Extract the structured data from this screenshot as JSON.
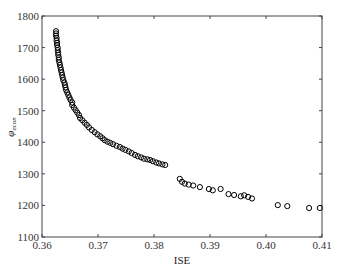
{
  "chart_data": {
    "type": "scatter",
    "title": "",
    "xlabel": "ISE",
    "ylabel": "φ_econ",
    "ylabel_main": "φ",
    "ylabel_sub": "econ",
    "xlim": [
      0.36,
      0.41
    ],
    "ylim": [
      1100,
      1800
    ],
    "xticks": [
      0.36,
      0.37,
      0.38,
      0.39,
      0.4,
      0.41
    ],
    "xtick_labels": [
      "0.36",
      "0.37",
      "0.38",
      "0.39",
      "0.40",
      "0.41"
    ],
    "yticks": [
      1100,
      1200,
      1300,
      1400,
      1500,
      1600,
      1700,
      1800
    ],
    "ytick_labels": [
      "1100",
      "1200",
      "1300",
      "1400",
      "1500",
      "1600",
      "1700",
      "1800"
    ],
    "grid": false,
    "legend": null,
    "marker": "open-circle",
    "marker_color": "#000000",
    "series": [
      {
        "name": "Pareto front",
        "points": [
          [
            0.3625,
            1752
          ],
          [
            0.3625,
            1745
          ],
          [
            0.3625,
            1738
          ],
          [
            0.3626,
            1730
          ],
          [
            0.3626,
            1722
          ],
          [
            0.3627,
            1715
          ],
          [
            0.3627,
            1708
          ],
          [
            0.3628,
            1700
          ],
          [
            0.3628,
            1692
          ],
          [
            0.3629,
            1684
          ],
          [
            0.3629,
            1677
          ],
          [
            0.363,
            1669
          ],
          [
            0.363,
            1661
          ],
          [
            0.3631,
            1653
          ],
          [
            0.3632,
            1645
          ],
          [
            0.3633,
            1637
          ],
          [
            0.3634,
            1629
          ],
          [
            0.3635,
            1621
          ],
          [
            0.3636,
            1613
          ],
          [
            0.3637,
            1605
          ],
          [
            0.3638,
            1597
          ],
          [
            0.364,
            1589
          ],
          [
            0.3641,
            1581
          ],
          [
            0.3642,
            1574
          ],
          [
            0.3643,
            1566
          ],
          [
            0.3645,
            1558
          ],
          [
            0.3647,
            1550
          ],
          [
            0.3649,
            1542
          ],
          [
            0.3651,
            1534
          ],
          [
            0.3654,
            1526
          ],
          [
            0.3654,
            1518
          ],
          [
            0.3657,
            1510
          ],
          [
            0.366,
            1502
          ],
          [
            0.3663,
            1494
          ],
          [
            0.3666,
            1486
          ],
          [
            0.3668,
            1477
          ],
          [
            0.3672,
            1470
          ],
          [
            0.3676,
            1462
          ],
          [
            0.368,
            1455
          ],
          [
            0.3684,
            1447
          ],
          [
            0.3689,
            1439
          ],
          [
            0.3694,
            1432
          ],
          [
            0.3699,
            1425
          ],
          [
            0.3704,
            1419
          ],
          [
            0.3708,
            1413
          ],
          [
            0.3712,
            1407
          ],
          [
            0.3717,
            1402
          ],
          [
            0.3722,
            1398
          ],
          [
            0.3727,
            1394
          ],
          [
            0.3733,
            1389
          ],
          [
            0.3739,
            1385
          ],
          [
            0.3744,
            1380
          ],
          [
            0.3749,
            1376
          ],
          [
            0.3755,
            1371
          ],
          [
            0.376,
            1366
          ],
          [
            0.3766,
            1360
          ],
          [
            0.3771,
            1356
          ],
          [
            0.3777,
            1352
          ],
          [
            0.3782,
            1348
          ],
          [
            0.3788,
            1346
          ],
          [
            0.3793,
            1344
          ],
          [
            0.3798,
            1340
          ],
          [
            0.3804,
            1336
          ],
          [
            0.3809,
            1333
          ],
          [
            0.3815,
            1330
          ],
          [
            0.382,
            1328
          ],
          [
            0.3846,
            1284
          ],
          [
            0.385,
            1275
          ],
          [
            0.3855,
            1269
          ],
          [
            0.3862,
            1266
          ],
          [
            0.387,
            1263
          ],
          [
            0.3882,
            1258
          ],
          [
            0.3898,
            1252
          ],
          [
            0.3905,
            1248
          ],
          [
            0.3919,
            1252
          ],
          [
            0.3933,
            1236
          ],
          [
            0.3943,
            1233
          ],
          [
            0.3955,
            1229
          ],
          [
            0.3961,
            1232
          ],
          [
            0.3968,
            1227
          ],
          [
            0.3975,
            1222
          ],
          [
            0.4021,
            1201
          ],
          [
            0.4038,
            1198
          ],
          [
            0.4077,
            1192
          ],
          [
            0.4096,
            1192
          ]
        ]
      }
    ]
  }
}
